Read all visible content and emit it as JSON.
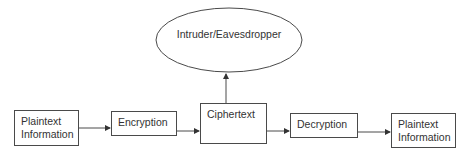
{
  "diagram": {
    "type": "flowchart",
    "nodes": [
      {
        "id": "plaintext-in",
        "label_line1": "Plaintext",
        "label_line2": "Information"
      },
      {
        "id": "encryption",
        "label": "Encryption"
      },
      {
        "id": "ciphertext",
        "label": "Ciphertext"
      },
      {
        "id": "decryption",
        "label": "Decryption"
      },
      {
        "id": "plaintext-out",
        "label_line1": "Plaintext",
        "label_line2": "Information"
      }
    ],
    "intruder": {
      "label": "Intruder/Eavesdropper",
      "shape": "ellipse"
    },
    "edges": [
      {
        "from": "plaintext-in",
        "to": "encryption"
      },
      {
        "from": "encryption",
        "to": "ciphertext"
      },
      {
        "from": "ciphertext",
        "to": "decryption"
      },
      {
        "from": "decryption",
        "to": "plaintext-out"
      },
      {
        "from": "ciphertext",
        "to": "intruder"
      }
    ],
    "colors": {
      "stroke": "#4a4a4a",
      "text": "#333333",
      "background": "#ffffff"
    }
  }
}
